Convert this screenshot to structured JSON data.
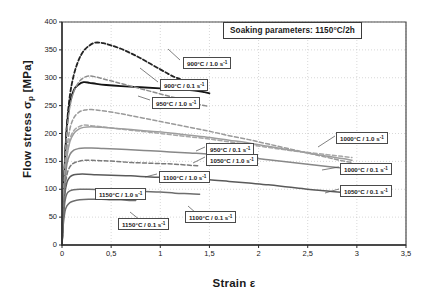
{
  "chart_data": {
    "type": "line",
    "title": "",
    "xlabel": "Strain ε",
    "ylabel": "Flow stress σp [MPa]",
    "ylabel_main": "Flow stress σ",
    "ylabel_sub": "p",
    "ylabel_unit": " [MPa]",
    "xlim": [
      0,
      3.5
    ],
    "ylim": [
      0,
      400
    ],
    "xticks": [
      "0",
      "0,5",
      "1",
      "1,5",
      "2",
      "2,5",
      "3",
      "3,5"
    ],
    "xtick_values": [
      0,
      0.5,
      1,
      1.5,
      2,
      2.5,
      3,
      3.5
    ],
    "yticks": [
      "0",
      "50",
      "100",
      "150",
      "200",
      "250",
      "300",
      "350",
      "400"
    ],
    "ytick_values": [
      0,
      50,
      100,
      150,
      200,
      250,
      300,
      350,
      400
    ],
    "grid": true,
    "grid_style": "dotted",
    "legend_position": "inline-callouts",
    "annotation": {
      "label": "Soaking parameters:  1150°C/2h",
      "text": "Soaking parameters:",
      "value": "1150°C/2h"
    },
    "series": [
      {
        "name": "900°C / 1.0 s⁻¹",
        "temperature": "900°C",
        "strain_rate": "1.0 s",
        "style": "dashed",
        "color": "#232323",
        "width": 1.8,
        "points": [
          [
            0,
            0
          ],
          [
            0.012,
            70
          ],
          [
            0.03,
            150
          ],
          [
            0.05,
            215
          ],
          [
            0.08,
            268
          ],
          [
            0.12,
            305
          ],
          [
            0.17,
            332
          ],
          [
            0.22,
            348
          ],
          [
            0.28,
            358
          ],
          [
            0.34,
            363
          ],
          [
            0.42,
            362
          ],
          [
            0.5,
            358
          ],
          [
            0.6,
            352
          ],
          [
            0.7,
            344
          ],
          [
            0.8,
            335
          ],
          [
            0.9,
            325
          ],
          [
            1.0,
            315
          ],
          [
            1.08,
            307
          ],
          [
            1.15,
            301
          ],
          [
            1.2,
            298
          ]
        ]
      },
      {
        "name": "900°C / 0.1 s⁻¹",
        "temperature": "900°C",
        "strain_rate": "0.1 s",
        "style": "solid",
        "color": "#141414",
        "width": 1.8,
        "points": [
          [
            0,
            0
          ],
          [
            0.012,
            75
          ],
          [
            0.03,
            155
          ],
          [
            0.05,
            212
          ],
          [
            0.08,
            255
          ],
          [
            0.12,
            278
          ],
          [
            0.17,
            288
          ],
          [
            0.22,
            292
          ],
          [
            0.28,
            291
          ],
          [
            0.35,
            289
          ],
          [
            0.45,
            287
          ],
          [
            0.6,
            285
          ],
          [
            0.8,
            283
          ],
          [
            1.0,
            281
          ],
          [
            1.2,
            279
          ],
          [
            1.35,
            277
          ],
          [
            1.45,
            274
          ],
          [
            1.5,
            272
          ]
        ]
      },
      {
        "name": "950°C / 1.0 s⁻¹",
        "temperature": "950°C",
        "strain_rate": "1.0 s",
        "style": "dashed",
        "color": "#8c8c8c",
        "width": 1.5,
        "points": [
          [
            0,
            0
          ],
          [
            0.012,
            72
          ],
          [
            0.03,
            150
          ],
          [
            0.05,
            205
          ],
          [
            0.08,
            248
          ],
          [
            0.12,
            275
          ],
          [
            0.17,
            292
          ],
          [
            0.22,
            300
          ],
          [
            0.27,
            303
          ],
          [
            0.33,
            302
          ],
          [
            0.42,
            298
          ],
          [
            0.55,
            292
          ],
          [
            0.7,
            285
          ],
          [
            0.85,
            278
          ],
          [
            1.0,
            271
          ],
          [
            1.15,
            264
          ],
          [
            1.3,
            257
          ],
          [
            1.4,
            252
          ],
          [
            1.48,
            249
          ]
        ]
      },
      {
        "name": "950°C / 0.1 s⁻¹",
        "temperature": "950°C",
        "strain_rate": "0.1 s",
        "style": "dashed",
        "color": "#9a9a9a",
        "width": 1.5,
        "points": [
          [
            0,
            0
          ],
          [
            0.012,
            62
          ],
          [
            0.03,
            125
          ],
          [
            0.05,
            172
          ],
          [
            0.08,
            208
          ],
          [
            0.12,
            228
          ],
          [
            0.17,
            238
          ],
          [
            0.23,
            242
          ],
          [
            0.3,
            243
          ],
          [
            0.4,
            241
          ],
          [
            0.55,
            237
          ],
          [
            0.7,
            232
          ],
          [
            0.9,
            225
          ],
          [
            1.1,
            218
          ],
          [
            1.3,
            211
          ],
          [
            1.5,
            204
          ],
          [
            1.7,
            196
          ],
          [
            1.9,
            189
          ],
          [
            2.1,
            181
          ],
          [
            2.3,
            173
          ],
          [
            2.5,
            165
          ],
          [
            2.7,
            157
          ],
          [
            2.85,
            151
          ],
          [
            2.95,
            148
          ]
        ]
      },
      {
        "name": "1000°C / 1.0 s⁻¹",
        "temperature": "1000°C",
        "strain_rate": "1.0 s",
        "style": "dashed",
        "color": "#a8a8a8",
        "width": 1.5,
        "points": [
          [
            0,
            0
          ],
          [
            0.012,
            60
          ],
          [
            0.03,
            120
          ],
          [
            0.05,
            160
          ],
          [
            0.08,
            190
          ],
          [
            0.12,
            205
          ],
          [
            0.17,
            212
          ],
          [
            0.22,
            215
          ],
          [
            0.3,
            214
          ],
          [
            0.4,
            212
          ],
          [
            0.55,
            209
          ],
          [
            0.7,
            206
          ],
          [
            0.9,
            202
          ],
          [
            1.1,
            198
          ],
          [
            1.3,
            194
          ],
          [
            1.5,
            190
          ],
          [
            1.7,
            185
          ],
          [
            1.9,
            180
          ],
          [
            2.1,
            175
          ],
          [
            2.3,
            170
          ],
          [
            2.5,
            166
          ],
          [
            2.7,
            162
          ],
          [
            2.85,
            159
          ],
          [
            2.95,
            157
          ]
        ]
      },
      {
        "name": "1000°C / 0.1 s⁻¹",
        "temperature": "1000°C",
        "strain_rate": "0.1 s",
        "style": "solid",
        "color": "#9e9e9e",
        "width": 1.5,
        "points": [
          [
            0,
            0
          ],
          [
            0.012,
            58
          ],
          [
            0.03,
            118
          ],
          [
            0.05,
            158
          ],
          [
            0.08,
            185
          ],
          [
            0.12,
            200
          ],
          [
            0.17,
            208
          ],
          [
            0.22,
            211
          ],
          [
            0.3,
            212
          ],
          [
            0.4,
            211
          ],
          [
            0.55,
            209
          ],
          [
            0.7,
            207
          ],
          [
            0.9,
            204
          ],
          [
            1.1,
            201
          ],
          [
            1.3,
            197
          ],
          [
            1.5,
            193
          ],
          [
            1.7,
            188
          ],
          [
            1.9,
            183
          ],
          [
            2.1,
            177
          ],
          [
            2.3,
            171
          ],
          [
            2.5,
            165
          ],
          [
            2.7,
            159
          ],
          [
            2.85,
            155
          ],
          [
            2.95,
            152
          ]
        ]
      },
      {
        "name": "1050°C / 1.0 s⁻¹",
        "temperature": "1050°C",
        "strain_rate": "1.0 s",
        "style": "solid",
        "color": "#888888",
        "width": 1.5,
        "points": [
          [
            0,
            0
          ],
          [
            0.012,
            55
          ],
          [
            0.03,
            110
          ],
          [
            0.05,
            145
          ],
          [
            0.08,
            162
          ],
          [
            0.12,
            170
          ],
          [
            0.17,
            173
          ],
          [
            0.23,
            174
          ],
          [
            0.3,
            174
          ],
          [
            0.42,
            173
          ],
          [
            0.55,
            172
          ],
          [
            0.7,
            171
          ],
          [
            0.9,
            169
          ],
          [
            1.1,
            167
          ],
          [
            1.3,
            165
          ],
          [
            1.5,
            163
          ],
          [
            1.7,
            160
          ],
          [
            1.9,
            157
          ],
          [
            2.1,
            153
          ],
          [
            2.3,
            149
          ],
          [
            2.5,
            145
          ],
          [
            2.7,
            141
          ],
          [
            2.85,
            138
          ],
          [
            2.95,
            136
          ]
        ]
      },
      {
        "name": "1050°C / 0.1 s⁻¹",
        "temperature": "1050°C",
        "strain_rate": "0.1 s",
        "style": "solid",
        "color": "#5a5a5a",
        "width": 1.5,
        "points": [
          [
            0,
            0
          ],
          [
            0.012,
            48
          ],
          [
            0.03,
            92
          ],
          [
            0.05,
            112
          ],
          [
            0.08,
            122
          ],
          [
            0.12,
            126
          ],
          [
            0.17,
            127
          ],
          [
            0.25,
            127
          ],
          [
            0.35,
            126
          ],
          [
            0.5,
            125
          ],
          [
            0.7,
            124
          ],
          [
            0.9,
            122
          ],
          [
            1.1,
            121
          ],
          [
            1.3,
            119
          ],
          [
            1.5,
            117
          ],
          [
            1.7,
            114
          ],
          [
            1.9,
            111
          ],
          [
            2.1,
            108
          ],
          [
            2.3,
            104
          ],
          [
            2.5,
            100
          ],
          [
            2.7,
            97
          ],
          [
            2.85,
            94
          ],
          [
            2.95,
            92
          ]
        ]
      },
      {
        "name": "1100°C / 1.0 s⁻¹",
        "temperature": "1100°C",
        "strain_rate": "1.0 s",
        "style": "dashed",
        "color": "#7a7a7a",
        "width": 1.5,
        "points": [
          [
            0,
            0
          ],
          [
            0.012,
            50
          ],
          [
            0.03,
            100
          ],
          [
            0.05,
            126
          ],
          [
            0.08,
            140
          ],
          [
            0.12,
            147
          ],
          [
            0.17,
            150
          ],
          [
            0.23,
            152
          ],
          [
            0.3,
            152
          ],
          [
            0.42,
            151
          ],
          [
            0.55,
            150
          ],
          [
            0.7,
            148
          ],
          [
            0.85,
            147
          ],
          [
            1.0,
            146
          ],
          [
            1.15,
            145
          ],
          [
            1.3,
            143
          ],
          [
            1.4,
            142
          ]
        ]
      },
      {
        "name": "1100°C / 0.1 s⁻¹",
        "temperature": "1100°C",
        "strain_rate": "0.1 s",
        "style": "solid",
        "color": "#6e6e6e",
        "width": 1.5,
        "points": [
          [
            0,
            0
          ],
          [
            0.012,
            42
          ],
          [
            0.03,
            78
          ],
          [
            0.05,
            92
          ],
          [
            0.08,
            97
          ],
          [
            0.12,
            99
          ],
          [
            0.18,
            100
          ],
          [
            0.27,
            100
          ],
          [
            0.4,
            99
          ],
          [
            0.55,
            98
          ],
          [
            0.7,
            97
          ],
          [
            0.85,
            96
          ],
          [
            1.0,
            95
          ],
          [
            1.15,
            93
          ],
          [
            1.3,
            92
          ],
          [
            1.4,
            91
          ]
        ]
      },
      {
        "name": "1150°C / 0.1 s⁻¹",
        "temperature": "1150°C",
        "strain_rate": "0.1 s",
        "style": "solid",
        "color": "#6e6e6e",
        "width": 1.5,
        "points": [
          [
            0,
            0
          ],
          [
            0.012,
            35
          ],
          [
            0.03,
            60
          ],
          [
            0.05,
            70
          ],
          [
            0.08,
            76
          ],
          [
            0.12,
            79
          ],
          [
            0.18,
            81
          ],
          [
            0.27,
            82
          ],
          [
            0.4,
            82
          ],
          [
            0.5,
            81
          ],
          [
            0.6,
            81
          ],
          [
            0.7,
            80
          ],
          [
            0.75,
            80
          ]
        ]
      }
    ],
    "callouts": [
      {
        "id": "c-900-10",
        "temperature": "900°C",
        "rate": "1.0 s",
        "label": "900°C / 1.0 s",
        "x": 183,
        "y": 57
      },
      {
        "id": "c-900-01",
        "temperature": "900°C",
        "rate": "0.1 s",
        "label": "900°C / 0.1 s",
        "x": 160,
        "y": 79
      },
      {
        "id": "c-950-10",
        "temperature": "950°C",
        "rate": "1.0 s",
        "label": "950°C / 1.0 s",
        "x": 152,
        "y": 97
      },
      {
        "id": "c-950-01",
        "temperature": "950°C",
        "rate": "0.1 s",
        "label": "950°C / 0.1 s",
        "x": 206,
        "y": 143
      },
      {
        "id": "c-1050-10",
        "temperature": "1050°C",
        "rate": "1.0 s",
        "label": "1050°C / 1.0 s",
        "x": 206,
        "y": 154
      },
      {
        "id": "c-1000-10",
        "temperature": "1000°C",
        "rate": "1.0 s",
        "label": "1000°C / 1.0 s",
        "x": 336,
        "y": 132
      },
      {
        "id": "c-1000-01",
        "temperature": "1000°C",
        "rate": "0.1 s",
        "label": "1000°C / 0.1 s",
        "x": 340,
        "y": 163
      },
      {
        "id": "c-1050-01",
        "temperature": "1050°C",
        "rate": "0.1 s",
        "label": "1050°C / 0.1 s",
        "x": 340,
        "y": 185
      },
      {
        "id": "c-1100-10",
        "temperature": "1100°C",
        "rate": "1.0 s",
        "label": "1100°C / 1.0 s",
        "x": 159,
        "y": 171
      },
      {
        "id": "c-1150-10",
        "temperature": "1150°C",
        "rate": "1.0 s",
        "label": "1150°C / 1.0 s",
        "x": 95,
        "y": 188
      },
      {
        "id": "c-1100-01",
        "temperature": "1100°C",
        "rate": "0.1 s",
        "label": "1100°C / 0.1 s",
        "x": 185,
        "y": 211
      },
      {
        "id": "c-1150-01",
        "temperature": "1150°C",
        "rate": "0.1 s",
        "label": "1150°C / 0.1 s",
        "x": 118,
        "y": 218
      }
    ],
    "leader_lines": [
      [
        [
          180,
          60
        ],
        [
          168,
          49
        ]
      ],
      [
        [
          158,
          82
        ],
        [
          140,
          68
        ]
      ],
      [
        [
          150,
          100
        ],
        [
          138,
          96
        ]
      ],
      [
        [
          205,
          147
        ],
        [
          196,
          151
        ]
      ],
      [
        [
          205,
          157
        ],
        [
          193,
          163
        ]
      ],
      [
        [
          335,
          136
        ],
        [
          318,
          147
        ]
      ],
      [
        [
          339,
          167
        ],
        [
          322,
          170
        ]
      ],
      [
        [
          339,
          189
        ],
        [
          325,
          193
        ]
      ],
      [
        [
          157,
          174
        ],
        [
          145,
          177
        ]
      ],
      [
        [
          120,
          191
        ],
        [
          108,
          196
        ]
      ],
      [
        [
          196,
          213
        ],
        [
          188,
          206
        ]
      ],
      [
        [
          140,
          220
        ],
        [
          130,
          212
        ]
      ]
    ]
  }
}
